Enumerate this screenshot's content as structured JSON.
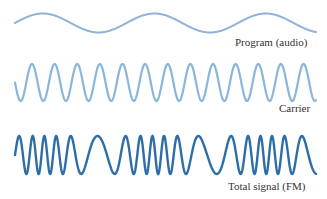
{
  "chart_data": {
    "type": "line",
    "title": "",
    "series": [
      {
        "name": "Program (audio)",
        "kind": "sine",
        "color": "#8fb3d6",
        "stroke_width": 2,
        "cycles": 2.7,
        "amplitude_px": 9.5,
        "center_y": 23,
        "start_phase_deg": 0
      },
      {
        "name": "Carrier",
        "kind": "sine",
        "color": "#8ab6db",
        "stroke_width": 2.2,
        "cycles": 13.3,
        "amplitude_px": 18.5,
        "center_y": 82.5,
        "start_phase_deg": 180
      },
      {
        "name": "Total signal (FM)",
        "kind": "fm",
        "color": "#2e6ea8",
        "stroke_width": 2.4,
        "amplitude_px": 19,
        "center_y": 155,
        "carrier_cycles": 17,
        "deviation": 0.55
      }
    ],
    "x_range_px": [
      15,
      316
    ]
  },
  "labels": {
    "program": "Program (audio)",
    "carrier": "Carrier",
    "total": "Total signal (FM)"
  }
}
